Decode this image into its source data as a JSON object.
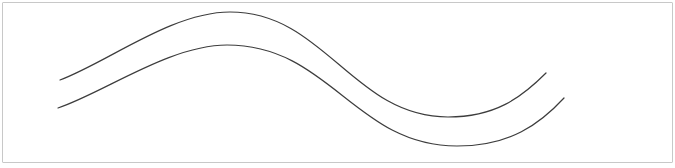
{
  "canvas": {
    "width": 675,
    "height": 168,
    "background_color": "#ffffff",
    "frame_border_color": "#c8c8c8",
    "stroke_color": "#3d3d3d",
    "stroke_width": 1.2
  },
  "curves": {
    "top": {
      "name": "top-wave-curve",
      "d": "M 60 80 C 108 62 172 12 230 12 C 325 12 353 117 448 117 C 495 117 521 98 546 73",
      "start": [
        60,
        80
      ],
      "crest": [
        230,
        12
      ],
      "trough": [
        448,
        117
      ],
      "end": [
        546,
        73
      ]
    },
    "bottom": {
      "name": "bottom-wave-curve",
      "d": "M 58 108 C 105 92 170 45 227 45 C 330 45 355 146 457 146 C 510 146 540 124 564 98",
      "start": [
        58,
        108
      ],
      "crest": [
        227,
        45
      ],
      "trough": [
        457,
        146
      ],
      "end": [
        564,
        98
      ]
    }
  }
}
